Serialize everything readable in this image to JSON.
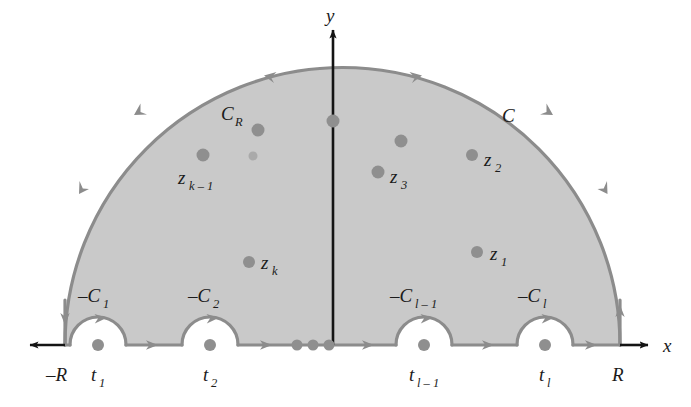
{
  "figure": {
    "type": "complex-contour-diagram",
    "colors": {
      "shade_fill": "#c9c9c9",
      "contour_stroke": "#8c8c8c",
      "pole_dot": "#8c8c8c",
      "axis": "#141414",
      "text": "#1b1b1b",
      "background": "#ffffff"
    },
    "axes": {
      "x_label": "x",
      "y_label": "y",
      "left_tick_label": "-R",
      "right_tick_label": "R"
    },
    "contour_labels": {
      "outer_arc": "C_R",
      "outer_contour": "C"
    },
    "singularity_labels": [
      {
        "name": "z_1",
        "base": "z",
        "sub": "1"
      },
      {
        "name": "z_2",
        "base": "z",
        "sub": "2"
      },
      {
        "name": "z_3",
        "base": "z",
        "sub": "3"
      },
      {
        "name": "z_k",
        "base": "z",
        "sub": "k"
      },
      {
        "name": "z_k-1",
        "base": "z",
        "sub": "k – 1"
      }
    ],
    "indentation_labels": [
      {
        "name": "-C_1",
        "base": "–C",
        "sub": "1"
      },
      {
        "name": "-C_2",
        "base": "–C",
        "sub": "2"
      },
      {
        "name": "-C_l-1",
        "base": "–C",
        "sub": "l – 1"
      },
      {
        "name": "-C_l",
        "base": "–C",
        "sub": "l"
      }
    ],
    "real_pole_labels": [
      {
        "name": "t_1",
        "base": "t",
        "sub": "1"
      },
      {
        "name": "t_2",
        "base": "t",
        "sub": "2"
      },
      {
        "name": "t_l-1",
        "base": "t",
        "sub": "l – 1"
      },
      {
        "name": "t_l",
        "base": "t",
        "sub": "l"
      }
    ],
    "ellipsis_dots_on_axis": 3,
    "glyphs": {
      "Ck_base": "C",
      "Ck_sub": "R",
      "C_outer": "C",
      "x": "x",
      "y": "y",
      "minusR": "–R",
      "R": "R",
      "z": "z",
      "t": "t",
      "minusC": "–C",
      "one": "1",
      "two": "2",
      "three": "3",
      "k": "k",
      "kminus1": "k – 1",
      "lminus1": "l – 1",
      "l": "l"
    }
  }
}
